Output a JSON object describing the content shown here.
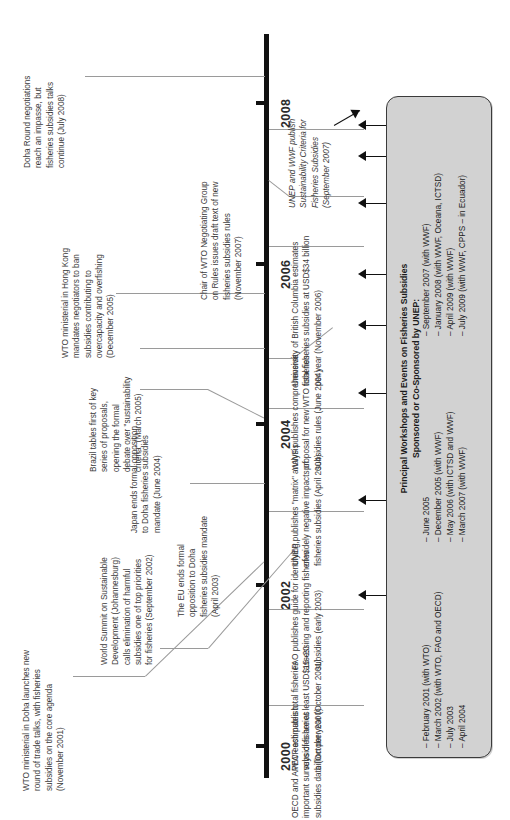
{
  "diagram": {
    "orientation": "vertical-axis-rotated-labels",
    "axis": {
      "color": "#111111",
      "years": [
        "2000",
        "2002",
        "2004",
        "2006",
        "2008"
      ]
    },
    "events_left": [
      {
        "id": "doha-round-impasse",
        "text": "Doha Round negotiations\nreach an impasse, but\nfisheries subsidies talks\ncontinue (July 2008)",
        "date": "July 2008"
      },
      {
        "id": "wto-hong-kong",
        "text": "WTO ministerial in Hong Kong\nmandates negotiators to ban\nsubsidies contributing to\novercapacity and overfishing\n(December 2005)",
        "date": "December 2005"
      },
      {
        "id": "brazil-tables-proposals",
        "text": "Brazil tables first of key\nseries of proposals,\nopening the formal\ndebate over \"sustainability\ncriteria\" (March 2005)",
        "date": "March 2005"
      },
      {
        "id": "japan-ends-opposition",
        "text": "Japan ends formal opposition\nto Doha fisheries subsidies\nmandate (June 2004)",
        "date": "June 2004"
      },
      {
        "id": "eu-ends-opposition",
        "text": "The EU ends formal\nopposition to Doha\nfisheries subsidies mandate\n(April 2003)",
        "date": "April 2003"
      },
      {
        "id": "world-summit-johannesburg",
        "text": "World Summit on Sustainable\nDevelopment (Johannesburg)\ncalls elimination of harmful\nsubsidies one of top priorities\nfor fisheries (September 2002)",
        "date": "September 2002"
      },
      {
        "id": "wto-ministerial-doha",
        "text": "WTO ministerial in Doha launches new\nround of trade talks, with fisheries\nsubsidies on the core agenda\n(November 2001)",
        "date": "November 2001"
      }
    ],
    "events_right": [
      {
        "id": "chair-wto-draft-text",
        "text": "Chair of WTO Negotiating Group\non Rules issues draft text of new\nfisheries subsidies rules\n(November 2007)",
        "date": "November 2007"
      },
      {
        "id": "unep-wwf-sustainability-criteria",
        "text": "UNEP and WWF publish\nSustainability Criteria for\nFisheries Subsidies\n(September 2007)",
        "date": "September 2007",
        "italic": true
      },
      {
        "id": "ubc-estimates",
        "text": "University of British Columbia estimates\ntotal fisheries subsidies at USD$34 billion\nper year (November 2006)",
        "date": "November 2006"
      },
      {
        "id": "wwf-comprehensive-proposal",
        "text": "WWF publishes comprehensive\nproposal for new WTO fisheries\nsubsidies rules (June 2004)",
        "date": "June 2004"
      },
      {
        "id": "unep-matrix-analysis",
        "text": "UNEP publishes \"matrix\" analysis\nof widely negative impacts of\nfisheries subsidies (April 2004)",
        "date": "April 2004"
      },
      {
        "id": "fao-guide",
        "text": "FAO publishes guide for identifying,\nassessing and reporting fisheries\nsubsidies (early 2003)",
        "date": "early 2003"
      },
      {
        "id": "wwf-estimates",
        "text": "WWF estimates total fisheries\nsubsidies are at least USD$15–20\nbillion per year (October 2001)",
        "date": "October 2001"
      },
      {
        "id": "oecd-apec-surveys",
        "text": "OECD and APEC each publish\nimportant surveys of fisheries\nsubsidies data (October 2000)",
        "date": "October 2000"
      }
    ],
    "callout_box": {
      "title": "Principal Workshops and Events on Fisheries Subsidies\nSponsored or Co-Sponsored by UNEP:",
      "column_1": "– February 2001 (with WTO)\n– March 2002 (with WTO, FAO and OECD)\n– July 2003\n– April 2004",
      "column_2": "– June 2005\n– December 2005 (with WWF)\n– May 2006 (with ICTSD and WWF)\n– March 2007 (with WWF)",
      "column_3": "– September 2007 (with WWF)\n– January 2008 (with WWF, Oceana, ICTSD)\n– April 2009 (with WWF)\n– July 2009 (with WWF, CPPS – in Ecuador)",
      "fill_color": "#d2d2d2",
      "border_color": "#3b3b3b",
      "arrow_count": 9
    }
  }
}
